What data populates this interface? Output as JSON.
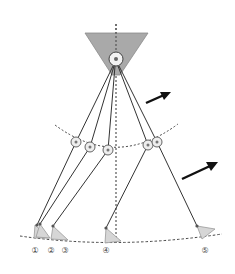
{
  "colors": {
    "hip_fill": "#a9a9a9",
    "foot_fill": "#d6d6d6",
    "line": "#333333",
    "joint_fill": "#eeeeee",
    "joint_dot": "#777777",
    "arrow": "#111111",
    "label": "#444444"
  },
  "hip": {
    "label": "hip-pivot"
  },
  "legs": [
    {
      "id": 1,
      "label": "①"
    },
    {
      "id": 2,
      "label": "②"
    },
    {
      "id": 3,
      "label": "③"
    },
    {
      "id": 4,
      "label": "④"
    },
    {
      "id": 5,
      "label": "⑤"
    }
  ],
  "arrows": [
    {
      "name": "motion-arrow-upper"
    },
    {
      "name": "motion-arrow-lower"
    }
  ]
}
